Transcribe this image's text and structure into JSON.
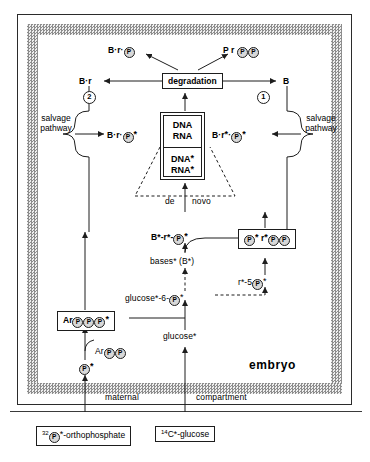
{
  "figure": {
    "region_labels": {
      "embryo": "embryo",
      "maternal": "maternal",
      "compartment": "compartment",
      "salvage_left_line1": "salvage",
      "salvage_left_line2": "pathway",
      "salvage_right_line1": "salvage",
      "salvage_right_line2": "pathway"
    },
    "nodes": {
      "degradation": "degradation",
      "brp_top_left": "B·r·",
      "prpp_top_right": "P  r",
      "br_left": "B·r",
      "b_right": "B",
      "brp_star_left": "B·r·",
      "brp_star_right": "B·r",
      "dna1": "DNA",
      "rna1": "RNA",
      "dna2": "DNA",
      "rna2": "RNA",
      "de": "de",
      "novo": "novo",
      "bstar_rstar_pstar": "B*-r*-",
      "bases_star": "bases* (B*)",
      "p_r_pp_star": "P",
      "r5p_star": "r*-5",
      "glucose6p_star": "glucose*-6-",
      "glucose_star": "glucose*",
      "arppp_star": "Ar",
      "arpp": "Ar",
      "p_star_bottom": "",
      "input_phosphate": "-orthophosphate",
      "input_phosphate_sup": "32",
      "input_glucose": "C*-glucose",
      "input_glucose_sup": "14",
      "circle_one": "1",
      "circle_two": "2"
    },
    "colors": {
      "ink": "#1d1d1d",
      "band_gray": "#8d8d8d",
      "circle_fill": "#d8d8d8",
      "background": "#ffffff"
    }
  }
}
